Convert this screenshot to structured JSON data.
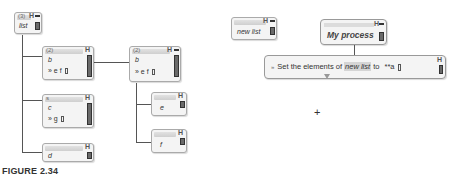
{
  "left_tree": {
    "root": {
      "count": "(3)",
      "label": "list"
    },
    "children": [
      {
        "count": "(2)",
        "label": "b",
        "items": "» e  f"
      },
      {
        "count": "s",
        "label": "c",
        "items": "» g"
      },
      {
        "count": "",
        "label": "d"
      }
    ],
    "expanded": {
      "count": "(2)",
      "label": "b",
      "items": "» e  f",
      "children": [
        {
          "label": "e"
        },
        {
          "label": "f"
        }
      ]
    }
  },
  "right_panel": {
    "variable_block": {
      "label": "new list"
    },
    "process_block": {
      "label": "My process"
    },
    "command_block": {
      "prefix": "»",
      "text_before": "Set  the elements of",
      "variable": "new list",
      "text_to": "to",
      "value": "**a"
    },
    "cursor": "+"
  },
  "glyphs": {
    "h_icon": "H"
  },
  "caption": "FIGURE 2.34"
}
